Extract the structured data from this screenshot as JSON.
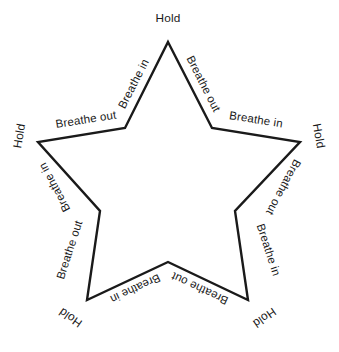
{
  "diagram": {
    "type": "star-breathing-exercise",
    "shape": "five-pointed-star",
    "stroke_color": "#1a1a1a",
    "fill_color": "#ffffff",
    "background_color": "#ffffff",
    "text_color": "#1a1a1a",
    "star_points": [
      {
        "name": "top",
        "x": 168,
        "y": 42
      },
      {
        "name": "right",
        "x": 300,
        "y": 142
      },
      {
        "name": "bottom-right",
        "x": 248,
        "y": 300
      },
      {
        "name": "bottom-left",
        "x": 87,
        "y": 300
      },
      {
        "name": "left",
        "x": 38,
        "y": 142
      }
    ],
    "inner_points": [
      {
        "name": "upper-right-inner",
        "x": 212,
        "y": 128
      },
      {
        "name": "right-inner",
        "x": 235,
        "y": 211
      },
      {
        "name": "bottom-inner",
        "x": 168,
        "y": 262
      },
      {
        "name": "left-inner",
        "x": 100,
        "y": 211
      },
      {
        "name": "upper-left-inner",
        "x": 125,
        "y": 128
      }
    ],
    "polygon_points": "168,42 212,128 300,142 235,211 248,300 168,262 87,300 100,211 38,142 125,128"
  },
  "labels": {
    "hold_top": "Hold",
    "hold_left": "Hold",
    "hold_right": "Hold",
    "hold_bottom_left": "Hold",
    "hold_bottom_right": "Hold",
    "breathe_in_top_left": "Breathe in",
    "breathe_out_top_right": "Breathe out",
    "breathe_in_right": "Breathe in",
    "breathe_out_left": "Breathe out",
    "breathe_out_right_lower": "Breathe out",
    "breathe_in_left_lower": "Breathe in",
    "breathe_in_bottom_right": "Breathe in",
    "breathe_out_bottom_left": "Breathe out",
    "breathe_out_bottom_inner_right": "Breathe out",
    "breathe_in_bottom_inner_left": "Breathe in"
  },
  "sequence": [
    "Hold",
    "Breathe in",
    "Hold",
    "Breathe out",
    "Hold",
    "Breathe in",
    "Hold",
    "Breathe out",
    "Hold",
    "Breathe in"
  ]
}
